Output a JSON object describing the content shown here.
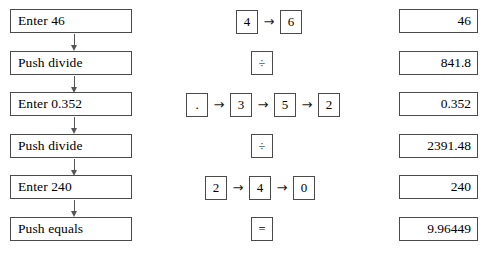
{
  "figure": {
    "rows": [
      {
        "action": "Enter 46",
        "has_connector_below": true,
        "keys": [
          {
            "type": "key",
            "label": "4"
          },
          {
            "type": "arrow",
            "label": "→"
          },
          {
            "type": "key",
            "label": "6"
          }
        ],
        "display": "46"
      },
      {
        "action": "Push divide",
        "has_connector_below": true,
        "keys": [
          {
            "type": "key",
            "label": "÷"
          }
        ],
        "display": "841.8"
      },
      {
        "action": "Enter 0.352",
        "has_connector_below": true,
        "keys": [
          {
            "type": "key",
            "label": "."
          },
          {
            "type": "arrow",
            "label": "→"
          },
          {
            "type": "key",
            "label": "3"
          },
          {
            "type": "arrow",
            "label": "→"
          },
          {
            "type": "key",
            "label": "5"
          },
          {
            "type": "arrow",
            "label": "→"
          },
          {
            "type": "key",
            "label": "2"
          }
        ],
        "display": "0.352"
      },
      {
        "action": "Push divide",
        "has_connector_below": true,
        "keys": [
          {
            "type": "key",
            "label": "÷"
          }
        ],
        "display": "2391.48"
      },
      {
        "action": "Enter 240",
        "has_connector_below": true,
        "keys": [
          {
            "type": "key",
            "label": "2"
          },
          {
            "type": "arrow",
            "label": "→"
          },
          {
            "type": "key",
            "label": "4"
          },
          {
            "type": "arrow",
            "label": "→"
          },
          {
            "type": "key",
            "label": "0"
          }
        ],
        "display": "240"
      },
      {
        "action": "Push equals",
        "has_connector_below": false,
        "keys": [
          {
            "type": "key",
            "label": "="
          }
        ],
        "display": "9.96449"
      }
    ],
    "colors": {
      "border": "#4a4a4a",
      "connector": "#555555",
      "text": "#000000",
      "background": "#ffffff"
    }
  }
}
